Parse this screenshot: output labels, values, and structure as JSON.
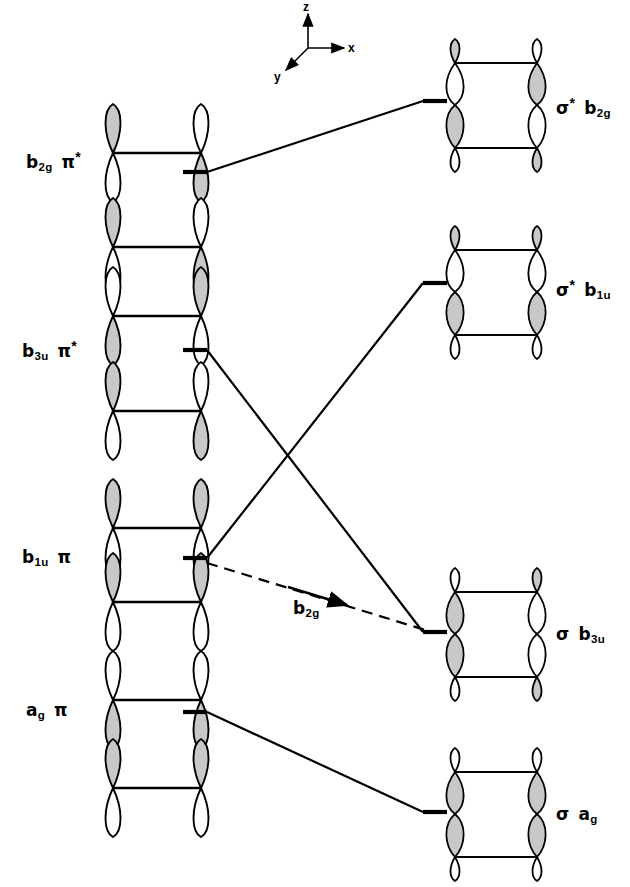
{
  "figure": {
    "type": "molecular-orbital-correlation-diagram",
    "title": "",
    "background_color": "#ffffff",
    "line_color": "#000000",
    "lobe_fill_shaded": "#c8c8c8",
    "lobe_fill_empty": "#ffffff"
  },
  "axes_indicator": {
    "name": "coordinate-axes",
    "z": "z",
    "x": "x",
    "y": "y",
    "origin": {
      "x": 308,
      "y": 48
    }
  },
  "left_column": {
    "name": "reactant-orbitals",
    "levels": [
      {
        "id": "b2g-pi-star",
        "symmetry": "b",
        "symmetry_sub": "2g",
        "orbital": "π",
        "star": "*",
        "label_text": "b2g π*",
        "level_y": 172,
        "label_x": 26,
        "label_y": 150
      },
      {
        "id": "b3u-pi-star",
        "symmetry": "b",
        "symmetry_sub": "3u",
        "orbital": "π",
        "star": "*",
        "label_text": "b3u π*",
        "level_y": 350,
        "label_x": 22,
        "label_y": 339
      },
      {
        "id": "b1u-pi",
        "symmetry": "b",
        "symmetry_sub": "1u",
        "orbital": "π",
        "star": "",
        "label_text": "b1u π",
        "level_y": 558,
        "label_x": 22,
        "label_y": 549
      },
      {
        "id": "ag-pi",
        "symmetry": "a",
        "symmetry_sub": "g",
        "orbital": "π",
        "star": "",
        "label_text": "ag π",
        "level_y": 712,
        "label_x": 26,
        "label_y": 702
      }
    ]
  },
  "right_column": {
    "name": "product-orbitals",
    "levels": [
      {
        "id": "sigma-star-b2g",
        "orbital": "σ",
        "star": "*",
        "symmetry": "b",
        "symmetry_sub": "2g",
        "label_text": "σ* b2g",
        "level_y": 101,
        "label_x": 556,
        "label_y": 96
      },
      {
        "id": "sigma-star-b1u",
        "orbital": "σ",
        "star": "*",
        "symmetry": "b",
        "symmetry_sub": "1u",
        "label_text": "σ* b1u",
        "level_y": 283,
        "label_x": 556,
        "label_y": 278
      },
      {
        "id": "sigma-b3u",
        "orbital": "σ",
        "star": "",
        "symmetry": "b",
        "symmetry_sub": "3u",
        "label_text": "σ b3u",
        "level_y": 632,
        "label_x": 556,
        "label_y": 626
      },
      {
        "id": "sigma-ag",
        "orbital": "σ",
        "star": "",
        "symmetry": "a",
        "symmetry_sub": "g",
        "label_text": "σ ag",
        "level_y": 812,
        "label_x": 556,
        "label_y": 806
      }
    ]
  },
  "correlations": [
    {
      "id": "corr-b2g",
      "from": "b2g-pi-star",
      "to": "sigma-star-b2g",
      "style": "solid"
    },
    {
      "id": "corr-b1u",
      "from": "b1u-pi",
      "to": "sigma-star-b1u",
      "style": "solid"
    },
    {
      "id": "corr-b3u",
      "from": "b3u-pi-star",
      "to": "sigma-b3u",
      "style": "solid"
    },
    {
      "id": "corr-ag",
      "from": "ag-pi",
      "to": "sigma-ag",
      "style": "solid"
    }
  ],
  "annotation": {
    "name": "b2g-dashed-correlation",
    "style": "dashed-with-arrow",
    "symmetry": "b",
    "symmetry_sub": "2g",
    "label_text": "b2g",
    "label_x": 293,
    "label_y": 600,
    "from": {
      "x": 207,
      "y": 563
    },
    "to": {
      "x": 435,
      "y": 633
    }
  }
}
